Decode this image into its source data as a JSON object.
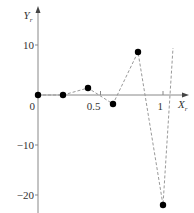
{
  "chart_data": {
    "type": "line",
    "title": "",
    "xlabel": "X_r",
    "ylabel": "Y_r",
    "x_axis_label": "X",
    "x_axis_sub": "r",
    "y_axis_label": "Y",
    "y_axis_sub": "r",
    "xlim": [
      -0.05,
      1.2
    ],
    "ylim": [
      -23,
      15
    ],
    "x_ticks": [
      {
        "value": 0,
        "label": "0"
      },
      {
        "value": 0.5,
        "label": "0.5"
      },
      {
        "value": 1,
        "label": "1"
      }
    ],
    "y_ticks": [
      {
        "value": 10,
        "label": "10"
      },
      {
        "value": -10,
        "label": "−10"
      },
      {
        "value": -20,
        "label": "−20"
      }
    ],
    "grid": false,
    "legend": null,
    "series": [
      {
        "name": "points",
        "marker": "circle",
        "line_style": "dashed",
        "x": [
          0,
          0.2,
          0.4,
          0.6,
          0.8,
          1.0
        ],
        "values": [
          0,
          0,
          1.4,
          -1.8,
          8.6,
          -22
        ]
      }
    ],
    "tail_line_end": {
      "x": 1.08,
      "y": 9.4
    },
    "colors": {
      "axis": "#888888",
      "marker": "#000000",
      "dashed_line": "#999999"
    }
  }
}
